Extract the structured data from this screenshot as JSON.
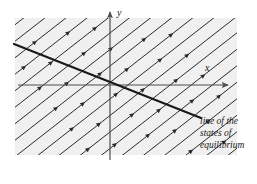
{
  "figure": {
    "name": "phase-portrait-line-of-equilibria",
    "background_color": "#ffffff",
    "plot_area": {
      "x": 15,
      "y": 18,
      "width": 222,
      "height": 137,
      "fill_color": "#f0f0f0"
    },
    "axes": {
      "origin": {
        "x": 110,
        "y": 85
      },
      "line_color": "#4d4d4d",
      "x_axis": {
        "label": "x",
        "label_x": 205,
        "label_y": 71,
        "from_x": 18,
        "to_x": 228,
        "y": 85,
        "arrow": "right"
      },
      "y_axis": {
        "label": "y",
        "label_x": 117,
        "label_y": 16,
        "from_y": 160,
        "to_y": 12,
        "x": 110,
        "arrow": "up"
      }
    },
    "equilibrium_line": {
      "label_lines": [
        "line of the",
        "states of",
        "equilibrium"
      ],
      "label_x": 200,
      "label_y": 124,
      "color": "#1a1a1a",
      "stroke_width": 2.2,
      "x1": 14,
      "y1": 44,
      "x2": 201,
      "y2": 118,
      "slope_note": "descending left-to-right through the origin"
    },
    "trajectories": {
      "color": "#2b2b2b",
      "stroke_width": 1.0,
      "direction": "northeast",
      "arrow_glyph": "arrowhead",
      "angle_degrees": 38,
      "perpendicular_spacing_px": 13,
      "count": 26,
      "description": "family of parallel straight trajectories approaching the line of states of equilibrium"
    }
  }
}
